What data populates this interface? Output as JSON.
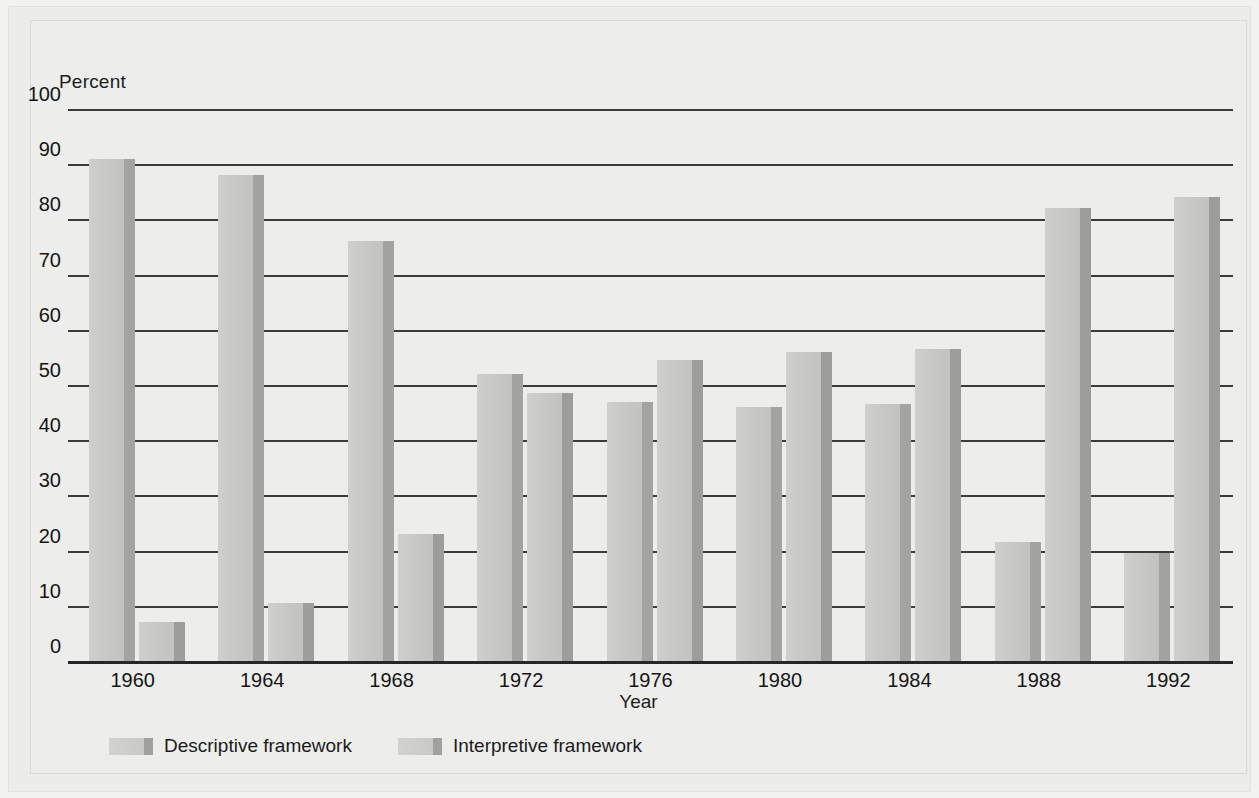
{
  "chart_data": {
    "type": "bar",
    "title": "",
    "xlabel": "Year",
    "ylabel": "Percent",
    "ylim": [
      0,
      100
    ],
    "yticks": [
      0,
      10,
      20,
      30,
      40,
      50,
      60,
      70,
      80,
      90,
      100
    ],
    "grid": true,
    "legend_position": "bottom-left",
    "categories": [
      "1960",
      "1964",
      "1968",
      "1972",
      "1976",
      "1980",
      "1984",
      "1988",
      "1992"
    ],
    "series": [
      {
        "name": "Descriptive framework",
        "values": [
          91,
          88,
          76,
          52,
          47,
          46,
          46.5,
          21.5,
          19.5
        ]
      },
      {
        "name": "Interpretive framework",
        "values": [
          7,
          10.5,
          23,
          48.5,
          54.5,
          56,
          56.5,
          82,
          84
        ]
      }
    ]
  },
  "axes": {
    "y_title": "Percent",
    "x_title": "Year",
    "y_tick_labels": [
      "100",
      "90",
      "80",
      "70",
      "60",
      "50",
      "40",
      "30",
      "20",
      "10",
      "0"
    ]
  },
  "legend": {
    "items": [
      {
        "label": "Descriptive framework"
      },
      {
        "label": "Interpretive framework"
      }
    ]
  },
  "colors": {
    "bar_face": "#c8c8c6",
    "bar_side": "#a0a09e",
    "gridline": "#3b3b3b",
    "background": "#ededec",
    "text": "#151515"
  }
}
